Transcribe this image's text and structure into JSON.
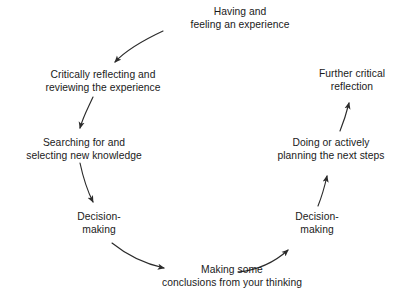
{
  "diagram": {
    "background_color": "#ffffff",
    "text_color": "#1a1a1a",
    "arrow_color": "#2b2b2b",
    "nodes": [
      {
        "id": "having-experience",
        "line1": "Having and",
        "line2": "feeling an experience",
        "x": 240,
        "y": 19
      },
      {
        "id": "critically-reflecting",
        "line1": "Critically reflecting and",
        "line2": "reviewing the experience",
        "x": 103,
        "y": 82
      },
      {
        "id": "searching-selecting",
        "line1": "Searching for and",
        "line2": "selecting new knowledge",
        "x": 84,
        "y": 150
      },
      {
        "id": "decision-making-left",
        "line1": "Decision-",
        "line2": "making",
        "x": 99,
        "y": 224
      },
      {
        "id": "making-conclusions",
        "line1": "Making some",
        "line2": "conclusions from your thinking",
        "x": 232,
        "y": 277
      },
      {
        "id": "decision-making-right",
        "line1": "Decision-",
        "line2": "making",
        "x": 317,
        "y": 224
      },
      {
        "id": "doing-planning",
        "line1": "Doing or actively",
        "line2": "planning the next steps",
        "x": 331,
        "y": 150
      },
      {
        "id": "further-reflection",
        "line1": "Further critical",
        "line2": "reflection",
        "x": 352,
        "y": 81
      }
    ],
    "arrows": [
      {
        "id": "arrow-experience-to-reflecting",
        "from": "having-experience",
        "to": "critically-reflecting",
        "path": "M 163 31 C 148 38 128 48 115 62"
      },
      {
        "id": "arrow-reflecting-to-searching",
        "from": "critically-reflecting",
        "to": "searching-selecting",
        "path": "M 93 97 C 88 108 83 117 80 128"
      },
      {
        "id": "arrow-searching-to-decision-left",
        "from": "searching-selecting",
        "to": "decision-making-left",
        "path": "M 80 163 C 83 177 88 192 93 202"
      },
      {
        "id": "arrow-decision-left-to-conclusions",
        "from": "decision-making-left",
        "to": "making-conclusions",
        "path": "M 112 243 C 128 256 146 264 164 268"
      },
      {
        "id": "arrow-conclusions-to-decision-right",
        "from": "making-conclusions",
        "to": "decision-making-right",
        "path": "M 238 272 C 258 270 276 261 288 250"
      },
      {
        "id": "arrow-decision-right-to-doing",
        "from": "decision-making-right",
        "to": "doing-planning",
        "path": "M 318 206 C 322 196 325 185 327 176"
      },
      {
        "id": "arrow-doing-to-further-reflection",
        "from": "doing-planning",
        "to": "further-reflection",
        "path": "M 340 131 C 344 121 347 111 349 103"
      }
    ]
  }
}
